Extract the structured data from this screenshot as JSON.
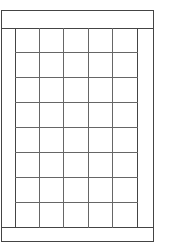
{
  "diagram": {
    "type": "grid-layout",
    "rows": 8,
    "columns": 5,
    "colors": {
      "line": "#444444",
      "grid_line": "#666666",
      "background": "#ffffff"
    },
    "regions": [
      "header",
      "left-margin",
      "grid",
      "right-margin",
      "footer"
    ]
  }
}
